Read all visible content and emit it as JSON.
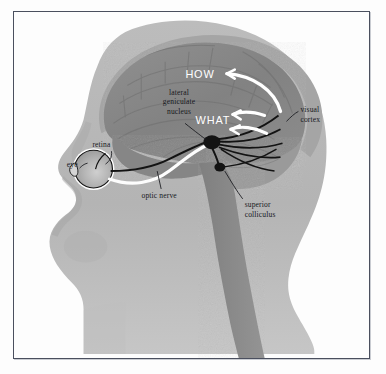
{
  "figure": {
    "type": "anatomical-diagram",
    "background_color": "#fdfdfd",
    "frame_color": "#4a4f5e"
  },
  "colors": {
    "head_silhouette": "#b6b6b6",
    "head_shadow": "#a8a8a8",
    "brain_body": "#8d8d8d",
    "brain_dark": "#7b7b7b",
    "skull_rim": "#a5a5a5",
    "brainstem": "#8a8a8a",
    "cerebellum": "#9a9a9a",
    "nerve_black": "#131313",
    "nerve_white": "#fdfdfd",
    "text": "#16181d",
    "stream_text": "#ffffff"
  },
  "labels": {
    "eye": "eye",
    "retina": "retina",
    "optic_nerve": "optic nerve",
    "lateral_geniculate_nucleus_line1": "lateral",
    "lateral_geniculate_nucleus_line2": "geniculate",
    "lateral_geniculate_nucleus_line3": "nucleus",
    "superior_colliculus_line1": "superior",
    "superior_colliculus_line2": "colliculus",
    "visual_cortex_line1": "visual",
    "visual_cortex_line2": "cortex",
    "stream_how": "HOW",
    "stream_what": "WHAT"
  },
  "structures": [
    {
      "name": "eye",
      "label": "eye"
    },
    {
      "name": "retina",
      "label": "retina"
    },
    {
      "name": "optic-nerve",
      "label": "optic nerve"
    },
    {
      "name": "lateral-geniculate-nucleus",
      "label": "lateral geniculate nucleus"
    },
    {
      "name": "superior-colliculus",
      "label": "superior colliculus"
    },
    {
      "name": "visual-cortex",
      "label": "visual cortex"
    }
  ],
  "pathways": [
    {
      "name": "dorsal-stream",
      "label": "HOW",
      "direction": "posterior-to-anterior-superior"
    },
    {
      "name": "ventral-stream",
      "label": "WHAT",
      "direction": "posterior-to-anterior-inferior"
    }
  ]
}
